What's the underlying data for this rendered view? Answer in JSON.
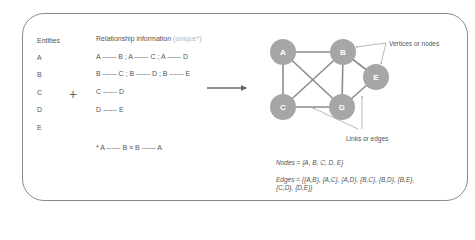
{
  "entities": {
    "title": "Entities",
    "items": [
      "A",
      "B",
      "C",
      "D",
      "E"
    ]
  },
  "plus_symbol": "+",
  "relationships": {
    "title": "Relationship information",
    "title_note": "(unique*)",
    "rows": [
      "A ------ B ; A ------ C ; A ------ D",
      "B ------ C ; B ------ D ; B ------ E",
      "C ------ D",
      "D ------ E"
    ],
    "footnote": "* A ------ B ≡ B ------ A"
  },
  "graph": {
    "node_color": "#a6a6a6",
    "edge_color": "#8c8c8c",
    "nodes": [
      {
        "id": "A",
        "x": 283,
        "y": 52
      },
      {
        "id": "B",
        "x": 343,
        "y": 52
      },
      {
        "id": "C",
        "x": 283,
        "y": 107
      },
      {
        "id": "D",
        "x": 342,
        "y": 107
      },
      {
        "id": "E",
        "x": 376,
        "y": 77
      }
    ],
    "edges": [
      [
        "A",
        "B"
      ],
      [
        "A",
        "C"
      ],
      [
        "A",
        "D"
      ],
      [
        "B",
        "C"
      ],
      [
        "B",
        "D"
      ],
      [
        "B",
        "E"
      ],
      [
        "C",
        "D"
      ],
      [
        "D",
        "E"
      ]
    ],
    "annotations": {
      "vertices_label": "Vertices or nodes",
      "edges_label": "Links or edges"
    }
  },
  "formulas": {
    "nodes": "Nodes = {A, B, C, D, E}",
    "edges_line1": "Edges = {{A,B}, {A,C}, {A,D}, {B,C}, {B,D}, {B,E},",
    "edges_line2": "{C,D}, {D,E}}"
  }
}
